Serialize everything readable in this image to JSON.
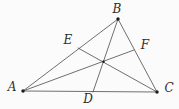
{
  "diagram": {
    "background_color": "#fbfbfb",
    "line_color": "#4b4b4b",
    "label_color": "#2e2e2e",
    "dot_color": "#1c1c1c",
    "labels": {
      "A": "A",
      "B": "B",
      "C": "C",
      "D": "D",
      "E": "E",
      "F": "F"
    },
    "points": {
      "A": {
        "x": 23,
        "y": 91,
        "dot": true,
        "dot_r": 1.7,
        "label": "A",
        "label_x": 12,
        "label_y": 91
      },
      "B": {
        "x": 118,
        "y": 19,
        "dot": true,
        "dot_r": 1.7,
        "label": "B",
        "label_x": 117,
        "label_y": 13
      },
      "C": {
        "x": 157,
        "y": 92,
        "dot": true,
        "dot_r": 1.7,
        "label": "C",
        "label_x": 169,
        "label_y": 92
      },
      "D": {
        "x": 93,
        "y": 92,
        "dot": false,
        "dot_r": 0,
        "label": "D",
        "label_x": 88,
        "label_y": 103
      },
      "E": {
        "x": 78,
        "y": 48,
        "dot": false,
        "dot_r": 0,
        "label": "E",
        "label_x": 68,
        "label_y": 44
      },
      "F": {
        "x": 134,
        "y": 50,
        "dot": false,
        "dot_r": 0,
        "label": "F",
        "label_x": 145,
        "label_y": 49
      },
      "G": {
        "x": 103.5,
        "y": 61.8,
        "dot": true,
        "dot_r": 1.2,
        "label": "",
        "label_x": 0,
        "label_y": 0
      }
    },
    "segments": [
      [
        "A",
        "B"
      ],
      [
        "B",
        "C"
      ],
      [
        "A",
        "C"
      ],
      [
        "A",
        "F"
      ],
      [
        "B",
        "D"
      ],
      [
        "C",
        "E"
      ]
    ],
    "stroke_width": 0.8
  }
}
